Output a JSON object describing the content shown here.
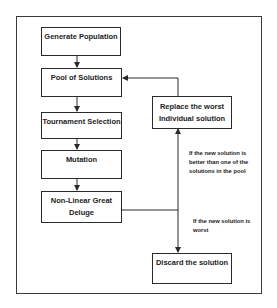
{
  "diagram": {
    "type": "flowchart",
    "nodes": {
      "generate": {
        "label": "Generate Population"
      },
      "pool": {
        "label": "Pool of Solutions"
      },
      "tournament": {
        "label": "Tournament Selection"
      },
      "mutation": {
        "label": "Mutation"
      },
      "nlgd": {
        "label": "Non-Linear Great Deluge"
      },
      "replace": {
        "label": "Replace the worst Individual solution"
      },
      "discard": {
        "label": "Discard the solution"
      }
    },
    "annotations": {
      "better": "If the new solution is better than one of the solutions in the pool",
      "worst": "If the new solution is worst"
    },
    "edges": [
      {
        "from": "generate",
        "to": "pool"
      },
      {
        "from": "pool",
        "to": "tournament"
      },
      {
        "from": "tournament",
        "to": "mutation"
      },
      {
        "from": "mutation",
        "to": "nlgd"
      },
      {
        "from": "nlgd",
        "to": "replace",
        "condition": "better"
      },
      {
        "from": "nlgd",
        "to": "discard",
        "condition": "worst"
      },
      {
        "from": "replace",
        "to": "pool"
      }
    ],
    "colors": {
      "stroke": "#2a2a2a",
      "text": "#222222",
      "background": "#ffffff"
    }
  }
}
